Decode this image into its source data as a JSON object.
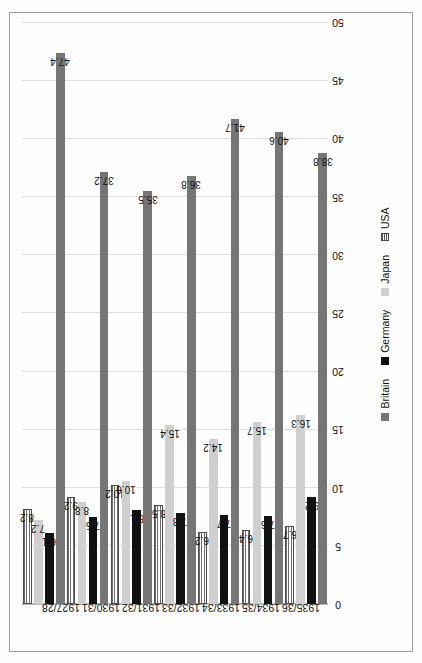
{
  "chart_data": {
    "type": "bar",
    "orientation": "horizontal",
    "categories": [
      "1927/28",
      "1930/31",
      "1931/32",
      "1932/33",
      "1933/34",
      "1934/35",
      "1935/36"
    ],
    "series": [
      {
        "name": "Britain",
        "color": "#767676",
        "pattern": "solid",
        "values": [
          47.4,
          37.2,
          35.5,
          36.8,
          41.7,
          40.6,
          38.8
        ]
      },
      {
        "name": "Germany",
        "color": "#111111",
        "pattern": "solid",
        "values": [
          6.1,
          7.5,
          8.1,
          7.8,
          7.7,
          7.6,
          9.2
        ]
      },
      {
        "name": "Japan",
        "color": "#cfcfcf",
        "pattern": "solid",
        "values": [
          7.2,
          8.8,
          10.6,
          15.4,
          14.2,
          15.7,
          16.3
        ]
      },
      {
        "name": "USA",
        "color": "#6e6e6e",
        "pattern": "horizontal-hatch",
        "values": [
          8.2,
          9.2,
          10.2,
          8.5,
          6.2,
          6.4,
          6.7
        ]
      }
    ],
    "title": "",
    "xlabel": "",
    "ylabel": "",
    "ylim": [
      0,
      50
    ],
    "yticks": [
      "0",
      "5",
      "10",
      "15",
      "20",
      "25",
      "30",
      "35",
      "40",
      "45",
      "50"
    ],
    "ytick_values": [
      0,
      5,
      10,
      15,
      20,
      25,
      30,
      35,
      40,
      45,
      50
    ],
    "grid": true,
    "data_labels": true,
    "legend_position": "bottom",
    "legend": [
      "Britain",
      "Germany",
      "Japan",
      "USA"
    ],
    "page_rotation_degrees": -90
  },
  "legend": {
    "items": [
      {
        "label": "Britain",
        "key": "britain"
      },
      {
        "label": "Germany",
        "key": "germany"
      },
      {
        "label": "Japan",
        "key": "japan"
      },
      {
        "label": "USA",
        "key": "usa"
      }
    ]
  },
  "axis": {
    "value_ticks": [
      "0",
      "5",
      "10",
      "15",
      "20",
      "25",
      "30",
      "35",
      "40",
      "45",
      "50"
    ]
  },
  "colors": {
    "britain": "#767676",
    "germany": "#111111",
    "japan": "#cfcfcf",
    "usa": "#6e6e6e",
    "gridline": "#dedede",
    "frame": "#9a9a9a",
    "text": "#111111"
  }
}
